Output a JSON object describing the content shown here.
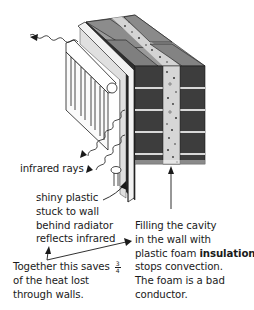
{
  "diagram": {
    "labels": {
      "infrared": "infrared rays",
      "shiny_plastic": [
        "shiny plastic",
        "stuck to wall",
        "behind radiator",
        "reflects infrared"
      ],
      "cavity_fill": {
        "line1": "Filling the cavity",
        "line2": "in the wall with",
        "line3_pre": "plastic foam ",
        "line3_bold": "insulation",
        "line4": "stops convection.",
        "line5": "The foam is a bad",
        "line6": "conductor."
      },
      "together": {
        "line1_pre": "Together this saves ",
        "frac_num": "3",
        "frac_den": "4",
        "line2": "of the heat lost",
        "line3": "through walls."
      }
    },
    "parts": [
      "radiator",
      "shiny plastic sheet",
      "inner brick wall",
      "foam-filled cavity",
      "outer brick wall",
      "infrared rays",
      "pointer arrows"
    ],
    "colors": {
      "brick": "#3d3d3d",
      "brick_top": "#8a8a8a",
      "mortar": "#d8d8d8",
      "foam": "#d6d6d6",
      "line": "#1a1a1a",
      "background": "#ffffff"
    }
  }
}
